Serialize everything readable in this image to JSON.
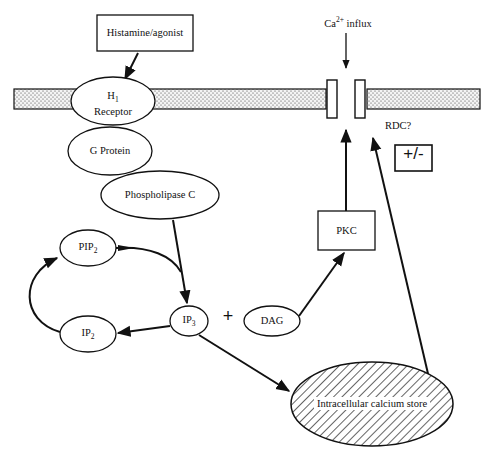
{
  "diagram": {
    "nodes": {
      "agonist": {
        "label": "Histamine/agonist",
        "shape": "rectangle"
      },
      "h1_receptor": {
        "label_main": "H",
        "label_sub": "1",
        "label_line2": "Receptor",
        "shape": "ellipse"
      },
      "g_protein": {
        "label": "G Protein",
        "shape": "ellipse"
      },
      "plc": {
        "label": "Phospholipase C",
        "shape": "ellipse"
      },
      "pip2": {
        "label_main": "PIP",
        "label_sub": "2",
        "shape": "ellipse"
      },
      "ip2": {
        "label_main": "IP",
        "label_sub": "2",
        "shape": "ellipse"
      },
      "ip3": {
        "label_main": "IP",
        "label_sub": "3",
        "shape": "ellipse"
      },
      "dag": {
        "label": "DAG",
        "shape": "ellipse"
      },
      "pkc": {
        "label": "PKC",
        "shape": "rectangle"
      },
      "store": {
        "label": "Intracellular calcium store",
        "shape": "hatched-ellipse"
      },
      "ca_influx": {
        "label_main": "Ca",
        "label_sup": "2+",
        "label_rest": " influx"
      },
      "rdc": {
        "label": "RDC?"
      },
      "modulation": {
        "label": "+/-",
        "shape": "rectangle"
      },
      "plus_sign": {
        "label": "+"
      }
    },
    "edges": [
      {
        "from": "Histamine/agonist",
        "to": "H1 Receptor"
      },
      {
        "from": "Phospholipase C",
        "to": "IP3"
      },
      {
        "from": "PIP2",
        "to": "IP3"
      },
      {
        "from": "IP3",
        "to": "IP2"
      },
      {
        "from": "IP2",
        "to": "PIP2"
      },
      {
        "from": "DAG",
        "to": "PKC"
      },
      {
        "from": "PKC",
        "to": "Ca2+ channel"
      },
      {
        "from": "IP3",
        "to": "Intracellular calcium store"
      },
      {
        "from": "Intracellular calcium store",
        "to": "Ca2+ channel (RDC?)"
      },
      {
        "from": "Ca2+ influx",
        "to": "Ca2+ channel"
      }
    ],
    "colors": {
      "line": "#111111",
      "membrane_fill": "#e8e8e8",
      "background": "#ffffff"
    }
  }
}
